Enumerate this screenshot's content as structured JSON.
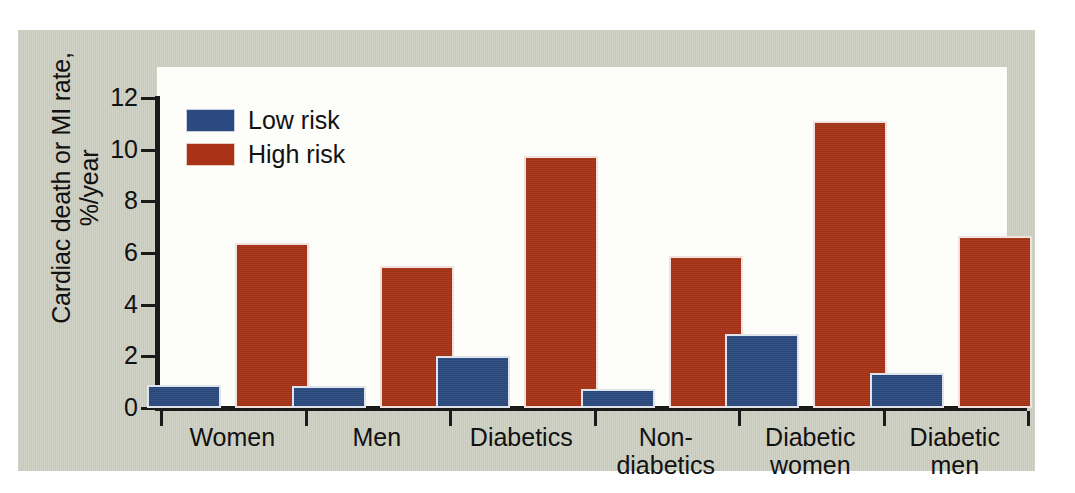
{
  "figure": {
    "background_color": "#cdd0c2",
    "plot_background_color": "#fdfdf9",
    "axis_color": "#1a1a1a"
  },
  "legend": {
    "position": "top-left-inside",
    "entries": [
      {
        "label": "Low risk",
        "color": "#2b4a80"
      },
      {
        "label": "High risk",
        "color": "#a83316"
      }
    ]
  },
  "axis": {
    "y_title_line1": "Cardiac death or MI rate,",
    "y_title_line2": "%/year",
    "y_ticks": [
      "12",
      "10",
      "8",
      "6",
      "4",
      "2",
      "0"
    ]
  },
  "chart_data": {
    "type": "bar",
    "title": "",
    "xlabel": "",
    "ylabel": "Cardiac death or MI rate, %/year",
    "ylim": [
      0,
      12
    ],
    "yticks": [
      0,
      2,
      4,
      6,
      8,
      10,
      12
    ],
    "grid": false,
    "legend_position": "upper left",
    "categories": [
      "Women",
      "Men",
      "Diabetics",
      "Non-diabetics",
      "Diabetic women",
      "Diabetic men"
    ],
    "category_labels_multiline": [
      [
        "Women"
      ],
      [
        "Men"
      ],
      [
        "Diabetics"
      ],
      [
        "Non-",
        "diabetics"
      ],
      [
        "Diabetic",
        "women"
      ],
      [
        "Diabetic",
        "men"
      ]
    ],
    "series": [
      {
        "name": "Low risk",
        "color": "#2b4a80",
        "values": [
          0.9,
          0.85,
          2.0,
          0.75,
          2.85,
          1.35
        ]
      },
      {
        "name": "High risk",
        "color": "#a83316",
        "values": [
          6.4,
          5.5,
          9.75,
          5.9,
          11.1,
          6.65
        ]
      }
    ]
  }
}
